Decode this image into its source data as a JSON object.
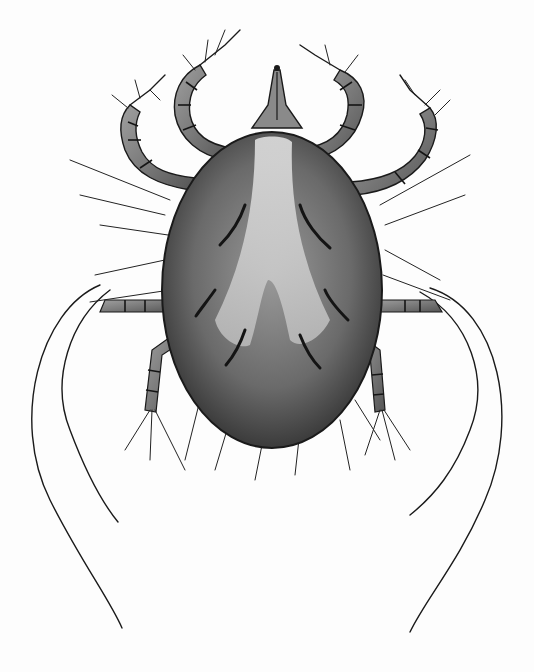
{
  "image": {
    "subject": "mite illustration",
    "description": "Grayscale pencil/ink scientific drawing of a mite viewed dorsally: oval shaded body with pale central V-shaped stripe, gnathosoma (mouthparts) at top, two pairs of segmented curled forelegs with setae, two pairs of hind legs with long trailing bristles",
    "colors": {
      "background": "#fdfdfd",
      "body_dark": "#3a3a3a",
      "body_mid": "#6e6e6e",
      "body_light": "#d8d8d8",
      "line": "#1a1a1a"
    }
  }
}
